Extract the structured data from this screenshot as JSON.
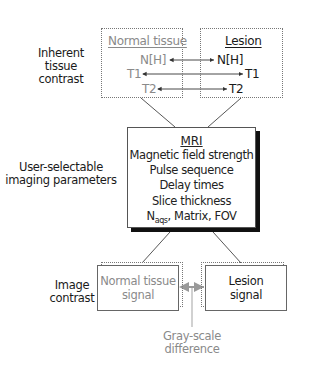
{
  "labels": {
    "inherent": [
      "Inherent",
      "tissue",
      "contrast"
    ],
    "user_selectable": [
      "User-selectable",
      "imaging parameters"
    ],
    "image_contrast": [
      "Image",
      "contrast"
    ],
    "grayscale": [
      "Gray-scale",
      "difference"
    ]
  },
  "normal_tissue": {
    "title": "Normal tissue",
    "items": [
      "N[H]",
      "T1",
      "T2"
    ]
  },
  "lesion": {
    "title": "Lesion",
    "items": [
      "N[H]",
      "T1",
      "T2"
    ]
  },
  "mri": {
    "title": "MRI",
    "lines": [
      "Magnetic field strength",
      "Pulse sequence",
      "Delay times",
      "Slice thickness"
    ],
    "last_line": {
      "n": "N",
      "sub": "aqs",
      "rest": ", Matrix, FOV"
    }
  },
  "signals": {
    "normal": [
      "Normal tissue",
      "signal"
    ],
    "lesion": [
      "Lesion",
      "signal"
    ]
  },
  "colors": {
    "normal_text": "#8a8a8a",
    "lesion_text": "#1a1a1a",
    "grayscale_arrow": "#9a9a9a",
    "shadow": "#111111"
  }
}
